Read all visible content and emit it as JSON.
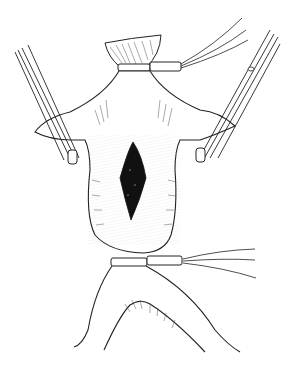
{
  "figure": {
    "type": "illustration",
    "elements": [
      {
        "name": "aneurysm-sac",
        "description": "fusiform vessel segment with dark elongated opening"
      },
      {
        "name": "upper-tourniquet",
        "description": "vessel loop band around upper vessel with tails to upper right"
      },
      {
        "name": "lower-tourniquet",
        "description": "vessel loop band around lower vessel with tails to right"
      },
      {
        "name": "left-clamp",
        "description": "clamp/forceps on left side branch"
      },
      {
        "name": "right-clamp",
        "description": "clamp/forceps on right side branch"
      },
      {
        "name": "bifurcation",
        "description": "vessel bifurcation below lower tourniquet"
      }
    ],
    "colors": {
      "background": "#ffffff",
      "ink": "#1a1a1a",
      "lumen": "#111111"
    }
  }
}
